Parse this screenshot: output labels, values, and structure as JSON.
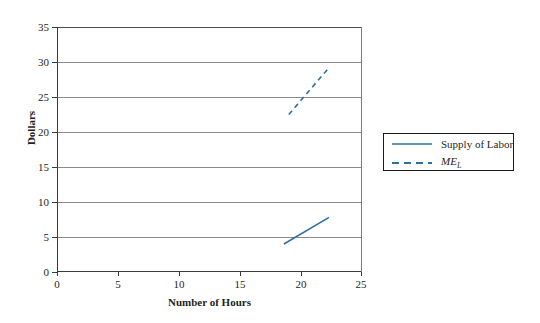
{
  "chart_data": {
    "type": "line",
    "title": "",
    "xlabel": "Number of Hours",
    "ylabel": "Dollars",
    "xlim": [
      0,
      25
    ],
    "ylim": [
      0,
      35
    ],
    "xticks": [
      0,
      5,
      10,
      15,
      20,
      25
    ],
    "yticks": [
      0,
      5,
      10,
      15,
      20,
      25,
      30,
      35
    ],
    "grid": "horizontal",
    "legend_position": "right",
    "series": [
      {
        "name": "Supply of Labor",
        "style": "solid",
        "color": "#2E6F9E",
        "x": [
          18.6,
          22.3
        ],
        "y": [
          4.0,
          7.8
        ]
      },
      {
        "name": "ME_L",
        "label_text": "ME",
        "label_sub": "L",
        "style": "dashed",
        "color": "#2E6F9E",
        "x": [
          19.0,
          22.2
        ],
        "y": [
          22.5,
          29.0
        ]
      }
    ]
  },
  "axes": {
    "y_tick_labels": [
      "0",
      "5",
      "10",
      "15",
      "20",
      "25",
      "30",
      "35"
    ],
    "x_tick_labels": [
      "0",
      "5",
      "10",
      "15",
      "20",
      "25"
    ],
    "y_title": "Dollars",
    "x_title": "Number of Hours"
  },
  "legend": {
    "items": [
      {
        "label": "Supply of Labor"
      },
      {
        "label": "ME",
        "sub": "L"
      }
    ]
  },
  "colors": {
    "series": "#2E6F9E",
    "grid": "#8A8A8A",
    "axis": "#3A3A3A",
    "text": "#231F20",
    "background": "#FFFFFF"
  }
}
